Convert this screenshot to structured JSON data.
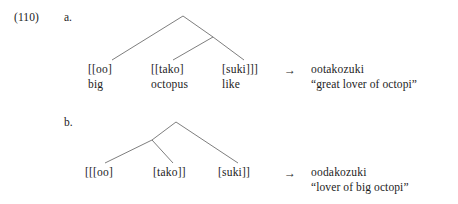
{
  "example": {
    "number": "(110)"
  },
  "items": [
    {
      "letter": "a.",
      "leaves": [
        {
          "label": "[[oo]",
          "gloss": "big"
        },
        {
          "label": "[[tako]",
          "gloss": "octopus"
        },
        {
          "label": "[suki]]]",
          "gloss": "like"
        }
      ],
      "arrow": "→",
      "surface_form": "ootakozuki",
      "translation": "“great lover of octopi”"
    },
    {
      "letter": "b.",
      "leaves": [
        {
          "label": "[[[oo]",
          "gloss": ""
        },
        {
          "label": "[tako]]",
          "gloss": ""
        },
        {
          "label": "[suki]]",
          "gloss": ""
        }
      ],
      "arrow": "→",
      "surface_form": "oodakozuki",
      "translation": "“lover of big octopi”"
    }
  ],
  "colors": {
    "text": "#1c1c1c",
    "tree_line": "#6f6f6f",
    "background": "#ffffff"
  }
}
